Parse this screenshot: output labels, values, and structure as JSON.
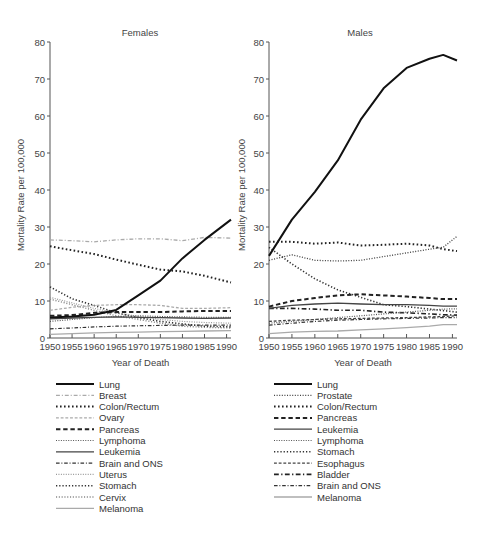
{
  "chart_data": [
    {
      "type": "line",
      "title": "Females",
      "xlabel": "Year of Death",
      "ylabel": "Mortality Rate per 100,000",
      "xlim": [
        1950,
        1991
      ],
      "ylim": [
        0,
        80
      ],
      "xticks": [
        1950,
        1955,
        1960,
        1965,
        1970,
        1975,
        1980,
        1985,
        1990
      ],
      "yticks": [
        0,
        10,
        20,
        30,
        40,
        50,
        60,
        70,
        80
      ],
      "grid": false,
      "legend_position": "below",
      "x": [
        1950,
        1955,
        1960,
        1965,
        1970,
        1975,
        1980,
        1985,
        1991
      ],
      "series": [
        {
          "name": "Lung",
          "style": "solid",
          "color": "#111111",
          "width": 2,
          "values": [
            5.5,
            5.8,
            6.3,
            7.6,
            11.5,
            15.5,
            21.5,
            26.5,
            32
          ]
        },
        {
          "name": "Breast",
          "style": "dashdot",
          "color": "#aaaaaa",
          "width": 1.3,
          "values": [
            26.5,
            26.3,
            26.0,
            26.5,
            26.8,
            26.8,
            26.3,
            27.2,
            27.0
          ]
        },
        {
          "name": "Colon/Rectum",
          "style": "dotted",
          "color": "#222222",
          "width": 2,
          "values": [
            24.8,
            23.7,
            22.7,
            21.2,
            19.8,
            18.5,
            18.0,
            16.8,
            15.0
          ]
        },
        {
          "name": "Ovary",
          "style": "dashed",
          "color": "#aaaaaa",
          "width": 1.3,
          "values": [
            7.5,
            8.3,
            8.8,
            9.0,
            9.0,
            8.8,
            8.0,
            8.0,
            8.2
          ]
        },
        {
          "name": "Pancreas",
          "style": "dashed",
          "color": "#222222",
          "width": 2,
          "values": [
            6.0,
            6.2,
            6.8,
            7.0,
            7.0,
            7.0,
            7.2,
            7.3,
            7.3
          ]
        },
        {
          "name": "Lymphoma",
          "style": "dotted",
          "color": "#555555",
          "width": 1.2,
          "values": [
            4.5,
            5.0,
            5.5,
            5.8,
            6.0,
            5.8,
            5.7,
            5.6,
            5.6
          ]
        },
        {
          "name": "Leukemia",
          "style": "solid",
          "color": "#444444",
          "width": 1.3,
          "values": [
            5.2,
            5.4,
            5.6,
            5.7,
            5.6,
            5.5,
            5.4,
            5.3,
            5.4
          ]
        },
        {
          "name": "Brain and ONS",
          "style": "dashdot",
          "color": "#333333",
          "width": 1.2,
          "values": [
            2.5,
            2.7,
            3.0,
            3.2,
            3.3,
            3.4,
            3.5,
            3.5,
            3.5
          ]
        },
        {
          "name": "Uterus",
          "style": "dotted",
          "color": "#999999",
          "width": 1.2,
          "values": [
            11.0,
            9.5,
            8.0,
            6.8,
            5.8,
            5.0,
            4.5,
            4.2,
            4.0
          ]
        },
        {
          "name": "Stomach",
          "style": "dotted",
          "color": "#333333",
          "width": 1.6,
          "values": [
            13.8,
            10.6,
            8.8,
            6.8,
            5.5,
            4.5,
            3.8,
            3.2,
            3.0
          ]
        },
        {
          "name": "Cervix",
          "style": "dotted",
          "color": "#888888",
          "width": 1.4,
          "values": [
            10.5,
            9.0,
            7.5,
            6.0,
            5.0,
            4.0,
            3.2,
            2.9,
            2.7
          ]
        },
        {
          "name": "Melanoma",
          "style": "solid",
          "color": "#aaaaaa",
          "width": 1.3,
          "values": [
            1.0,
            1.2,
            1.4,
            1.5,
            1.6,
            1.7,
            1.8,
            1.9,
            2.0
          ]
        }
      ]
    },
    {
      "type": "line",
      "title": "Males",
      "xlabel": "Year of Death",
      "ylabel": "Mortality Rate per 100,000",
      "xlim": [
        1950,
        1991
      ],
      "ylim": [
        0,
        80
      ],
      "xticks": [
        1950,
        1955,
        1960,
        1965,
        1970,
        1975,
        1980,
        1985,
        1990
      ],
      "yticks": [
        0,
        10,
        20,
        30,
        40,
        50,
        60,
        70,
        80
      ],
      "grid": false,
      "legend_position": "below",
      "x": [
        1950,
        1955,
        1960,
        1965,
        1970,
        1975,
        1980,
        1985,
        1988,
        1991
      ],
      "series": [
        {
          "name": "Lung",
          "style": "solid",
          "color": "#111111",
          "width": 2,
          "values": [
            22.2,
            32.0,
            39.5,
            48.0,
            59.0,
            67.5,
            73.0,
            75.5,
            76.5,
            75.0
          ]
        },
        {
          "name": "Prostate",
          "style": "dotted",
          "color": "#444444",
          "width": 1.3,
          "values": [
            21.0,
            22.5,
            21.0,
            20.8,
            21.0,
            22.0,
            23.0,
            24.0,
            24.5,
            27.5
          ]
        },
        {
          "name": "Colon/Rectum",
          "style": "dotted",
          "color": "#222222",
          "width": 2,
          "values": [
            26.0,
            26.0,
            25.5,
            25.8,
            25.0,
            25.2,
            25.5,
            25.0,
            24.0,
            23.5
          ]
        },
        {
          "name": "Pancreas",
          "style": "dashed",
          "color": "#222222",
          "width": 2,
          "values": [
            8.5,
            10.0,
            10.8,
            11.5,
            11.8,
            11.5,
            11.2,
            10.8,
            10.5,
            10.5
          ]
        },
        {
          "name": "Leukemia",
          "style": "solid",
          "color": "#444444",
          "width": 1.3,
          "values": [
            8.0,
            8.8,
            9.2,
            9.4,
            9.2,
            9.0,
            9.0,
            8.8,
            8.6,
            8.6
          ]
        },
        {
          "name": "Lymphoma",
          "style": "dotted",
          "color": "#555555",
          "width": 1.2,
          "values": [
            4.0,
            4.5,
            5.0,
            5.5,
            6.0,
            6.5,
            7.0,
            7.5,
            7.8,
            7.9
          ]
        },
        {
          "name": "Stomach",
          "style": "dotted",
          "color": "#333333",
          "width": 1.6,
          "values": [
            24.5,
            20.0,
            16.0,
            13.0,
            11.0,
            9.0,
            8.5,
            7.8,
            7.4,
            7.0
          ]
        },
        {
          "name": "Esophagus",
          "style": "dashed",
          "color": "#444444",
          "width": 1.3,
          "values": [
            4.5,
            4.8,
            5.0,
            5.2,
            5.3,
            5.4,
            5.5,
            5.7,
            5.8,
            6.0
          ]
        },
        {
          "name": "Bladder",
          "style": "dashdot",
          "color": "#222222",
          "width": 1.6,
          "values": [
            8.0,
            8.0,
            7.8,
            7.5,
            7.5,
            7.0,
            6.8,
            6.5,
            6.3,
            6.2
          ]
        },
        {
          "name": "Brain and ONS",
          "style": "dashdot",
          "color": "#333333",
          "width": 1.2,
          "values": [
            3.5,
            4.0,
            4.5,
            4.8,
            5.0,
            5.2,
            5.3,
            5.4,
            5.5,
            5.5
          ]
        },
        {
          "name": "Melanoma",
          "style": "solid",
          "color": "#aaaaaa",
          "width": 1.3,
          "values": [
            1.2,
            1.6,
            1.8,
            1.9,
            2.2,
            2.5,
            2.8,
            3.2,
            3.6,
            3.6
          ]
        }
      ]
    }
  ]
}
